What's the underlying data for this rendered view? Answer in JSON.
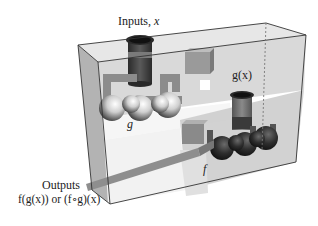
{
  "diagram": {
    "type": "composite-function-machine",
    "labels": {
      "inputs": "Inputs, x",
      "inputs_prefix": "Inputs, ",
      "inputs_var": "x",
      "g_output": "g(x)",
      "g_machine": "g",
      "f_machine": "f",
      "outputs_title": "Outputs",
      "outputs_formula": "f(g(x)) or (f∘g)(x)"
    },
    "colors": {
      "frame": "#333333",
      "glass": "#d8d8d8",
      "sphere_light": "#f2f2f2",
      "sphere_dark": "#1e1e1e",
      "pipe": "#8a8a8a",
      "funnel_dark": "#3a3a3a"
    }
  }
}
